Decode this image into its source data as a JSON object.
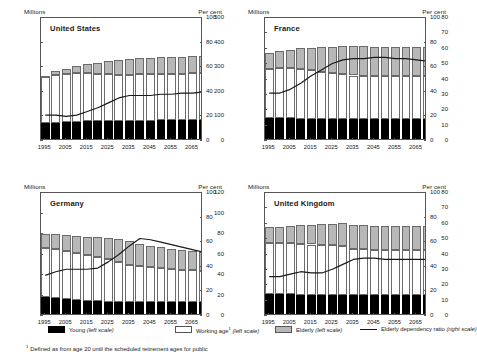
{
  "figure": {
    "axis_unit_left": "Millions",
    "axis_unit_right": "Per cent",
    "footnote_marker": "1",
    "footnote": "Defined as from age 20 until the scheduled retirement ages for public"
  },
  "legend": {
    "items": [
      {
        "key": "young",
        "label": "Young",
        "scale": "(left scale)",
        "swatch": "black-filled-rect",
        "color": "#000000"
      },
      {
        "key": "working",
        "label": "Working age",
        "marker": "1",
        "scale": "(left scale)",
        "swatch": "white-outlined-rect",
        "color": "#ffffff"
      },
      {
        "key": "elderly",
        "label": "Elderly",
        "scale": "(left scale)",
        "swatch": "grey-filled-rect",
        "color": "#b8b8b8"
      },
      {
        "key": "ratio",
        "label": "Elderly dependency ratio",
        "scale": "(right scale)",
        "swatch": "solid-line",
        "color": "#1a1a1a"
      }
    ]
  },
  "chart_data": [
    {
      "type": "bar",
      "id": "united-states",
      "title": "United States",
      "xlabel": "",
      "ylabel": "Millions",
      "ylabel_right": "Per cent",
      "ylim": [
        0,
        500
      ],
      "yticks": [
        0,
        100,
        200,
        300,
        400,
        500
      ],
      "ylim_right": [
        0,
        100
      ],
      "yticks_right": [
        0,
        20,
        40,
        60,
        80,
        100
      ],
      "xticks": [
        1995,
        2005,
        2015,
        2025,
        2035,
        2045,
        2055,
        2065
      ],
      "xlim": [
        1993,
        2070
      ],
      "grid": false,
      "legend_position": "below-figure",
      "x": [
        1995,
        2000,
        2005,
        2010,
        2015,
        2020,
        2025,
        2030,
        2035,
        2040,
        2045,
        2050,
        2055,
        2060,
        2065,
        2070
      ],
      "series": [
        {
          "name": "Young (left scale)",
          "values": [
            73,
            75,
            77,
            79,
            80,
            80,
            81,
            81,
            82,
            82,
            83,
            84,
            84,
            85,
            86,
            86
          ]
        },
        {
          "name": "Working age (left scale)",
          "values": [
            190,
            192,
            194,
            197,
            195,
            192,
            190,
            188,
            188,
            189,
            190,
            190,
            189,
            189,
            189,
            190
          ]
        },
        {
          "name": "Elderly (left scale)",
          "values": [
            0,
            17,
            22,
            29,
            37,
            46,
            54,
            61,
            65,
            66,
            66,
            66,
            68,
            69,
            70,
            71
          ]
        }
      ],
      "stacked_totals": [
        263,
        284,
        293,
        305,
        312,
        318,
        325,
        330,
        335,
        337,
        339,
        340,
        341,
        343,
        345,
        347
      ],
      "ratio_line": {
        "name": "Elderly dependency ratio (right scale)",
        "x": [
          1995,
          2000,
          2005,
          2010,
          2015,
          2020,
          2025,
          2030,
          2035,
          2040,
          2045,
          2050,
          2055,
          2060,
          2065,
          2070
        ],
        "values": [
          21,
          21,
          20,
          21,
          24,
          27,
          31,
          35,
          37,
          37,
          37,
          38,
          38,
          39,
          39,
          40
        ]
      }
    },
    {
      "type": "bar",
      "id": "france",
      "title": "France",
      "xlabel": "",
      "ylabel": "Millions",
      "ylabel_right": "Per cent",
      "ylim": [
        0,
        80
      ],
      "yticks": [
        0,
        10,
        20,
        30,
        40,
        50,
        60,
        70,
        80
      ],
      "ylim_right": [
        0,
        100
      ],
      "yticks_right": [
        0,
        20,
        40,
        60,
        80,
        100
      ],
      "xticks": [
        1995,
        2005,
        2015,
        2025,
        2035,
        2045,
        2055,
        2065
      ],
      "xlim": [
        1993,
        2070
      ],
      "grid": false,
      "legend_position": "below-figure",
      "x": [
        1995,
        2000,
        2005,
        2010,
        2015,
        2020,
        2025,
        2030,
        2035,
        2040,
        2045,
        2050,
        2055,
        2060,
        2065,
        2070
      ],
      "series": [
        {
          "name": "Young (left scale)",
          "values": [
            15.2,
            15.0,
            14.8,
            14.6,
            14.5,
            14.4,
            14.3,
            14.3,
            14.2,
            14.2,
            14.2,
            14.2,
            14.2,
            14.2,
            14.2,
            14.2
          ]
        },
        {
          "name": "Working age (left scale)",
          "values": [
            31.5,
            32.3,
            32.5,
            32.3,
            31.5,
            30.5,
            29.7,
            29.0,
            28.4,
            28.2,
            28.0,
            27.9,
            27.9,
            28.0,
            28.0,
            28.0
          ]
        },
        {
          "name": "Elderly (left scale)",
          "values": [
            10.8,
            11.2,
            12.2,
            13.3,
            14.6,
            16.0,
            17.3,
            18.4,
            19.1,
            19.2,
            19.2,
            19.1,
            19.0,
            18.9,
            18.9,
            18.9
          ]
        }
      ],
      "stacked_totals": [
        57.5,
        58.5,
        59.5,
        60.2,
        60.6,
        60.9,
        61.3,
        61.7,
        61.7,
        61.6,
        61.4,
        61.2,
        61.1,
        61.1,
        61.1,
        61.1
      ],
      "ratio_line": {
        "name": "Elderly dependency ratio (right scale)",
        "x": [
          1995,
          2000,
          2005,
          2010,
          2015,
          2020,
          2025,
          2030,
          2035,
          2040,
          2045,
          2050,
          2055,
          2060,
          2065,
          2070
        ],
        "values": [
          39,
          39,
          42,
          47,
          53,
          58,
          63,
          66,
          67,
          67,
          68,
          68,
          67,
          67,
          66,
          65
        ]
      }
    },
    {
      "type": "bar",
      "id": "germany",
      "title": "Germany",
      "xlabel": "",
      "ylabel": "Millions",
      "ylabel_right": "Per cent",
      "ylim": [
        0,
        120
      ],
      "yticks": [
        0,
        20,
        40,
        60,
        80,
        100,
        120
      ],
      "ylim_right": [
        0,
        100
      ],
      "yticks_right": [
        0,
        20,
        40,
        60,
        80,
        100
      ],
      "xticks": [
        1995,
        2005,
        2015,
        2025,
        2035,
        2045,
        2055,
        2065
      ],
      "xlim": [
        1993,
        2070
      ],
      "grid": false,
      "legend_position": "below-figure",
      "x": [
        1995,
        2000,
        2005,
        2010,
        2015,
        2020,
        2025,
        2030,
        2035,
        2040,
        2045,
        2050,
        2055,
        2060,
        2065,
        2070
      ],
      "series": [
        {
          "name": "Young (left scale)",
          "values": [
            19.0,
            18.0,
            16.5,
            15.5,
            14.8,
            14.3,
            14.0,
            13.8,
            13.6,
            13.5,
            13.4,
            13.3,
            13.2,
            13.2,
            13.2,
            13.2
          ]
        },
        {
          "name": "Working age (left scale)",
          "values": [
            47.0,
            47.5,
            47.0,
            46.0,
            45.0,
            43.5,
            41.5,
            39.2,
            36.5,
            35.0,
            34.0,
            33.3,
            32.6,
            32.0,
            31.5,
            31.0
          ]
        },
        {
          "name": "Elderly (left scale)",
          "values": [
            14.0,
            14.5,
            15.5,
            16.5,
            17.5,
            19.0,
            20.8,
            22.5,
            22.6,
            21.8,
            21.0,
            20.4,
            19.9,
            19.4,
            19.0,
            18.6
          ]
        }
      ],
      "stacked_totals": [
        80.0,
        80.0,
        79.0,
        78.0,
        77.3,
        76.8,
        76.3,
        75.5,
        72.7,
        70.3,
        68.4,
        67.0,
        65.7,
        64.6,
        63.7,
        62.8
      ],
      "ratio_line": {
        "name": "Elderly dependency ratio (right scale)",
        "x": [
          1995,
          2000,
          2005,
          2010,
          2015,
          2020,
          2025,
          2030,
          2035,
          2040,
          2045,
          2050,
          2055,
          2060,
          2065,
          2070
        ],
        "values": [
          33,
          36,
          38,
          38,
          38,
          39,
          44,
          50,
          57,
          63,
          62,
          60,
          58,
          56,
          54,
          52
        ]
      }
    },
    {
      "type": "bar",
      "id": "united-kingdom",
      "title": "United Kingdom",
      "xlabel": "",
      "ylabel": "Millions",
      "ylabel_right": "Per cent",
      "ylim": [
        0,
        80
      ],
      "yticks": [
        0,
        10,
        20,
        30,
        40,
        50,
        60,
        70,
        80
      ],
      "ylim_right": [
        0,
        100
      ],
      "yticks_right": [
        0,
        20,
        40,
        60,
        80,
        100
      ],
      "xticks": [
        1995,
        2005,
        2015,
        2025,
        2035,
        2045,
        2055,
        2065
      ],
      "xlim": [
        1993,
        2070
      ],
      "grid": false,
      "legend_position": "below-figure",
      "x": [
        1995,
        2000,
        2005,
        2010,
        2015,
        2020,
        2025,
        2030,
        2035,
        2040,
        2045,
        2050,
        2055,
        2060,
        2065,
        2070
      ],
      "series": [
        {
          "name": "Young (left scale)",
          "values": [
            14.6,
            14.4,
            14.0,
            13.7,
            13.6,
            13.6,
            13.6,
            13.6,
            13.6,
            13.6,
            13.6,
            13.6,
            13.6,
            13.6,
            13.6,
            13.6
          ]
        },
        {
          "name": "Working age (left scale)",
          "values": [
            32.6,
            32.9,
            33.2,
            33.3,
            32.9,
            32.5,
            32.3,
            31.8,
            30.2,
            29.8,
            29.6,
            29.5,
            29.5,
            29.5,
            29.4,
            29.4
          ]
        },
        {
          "name": "Elderly (left scale)",
          "values": [
            10.6,
            10.8,
            11.2,
            11.9,
            12.7,
            13.5,
            14.2,
            15.1,
            15.5,
            15.5,
            15.4,
            15.4,
            15.4,
            15.4,
            15.5,
            15.5
          ]
        }
      ],
      "stacked_totals": [
        57.8,
        58.1,
        58.4,
        58.9,
        59.2,
        59.6,
        60.1,
        60.5,
        59.3,
        58.9,
        58.6,
        58.5,
        58.5,
        58.5,
        58.5,
        58.5
      ],
      "ratio_line": {
        "name": "Elderly dependency ratio (right scale)",
        "x": [
          1995,
          2000,
          2005,
          2010,
          2015,
          2020,
          2025,
          2030,
          2035,
          2040,
          2045,
          2050,
          2055,
          2060,
          2065,
          2070
        ],
        "values": [
          32,
          32,
          34,
          36,
          35,
          35,
          38,
          42,
          46,
          47,
          47,
          46,
          46,
          46,
          46,
          46
        ]
      }
    }
  ]
}
